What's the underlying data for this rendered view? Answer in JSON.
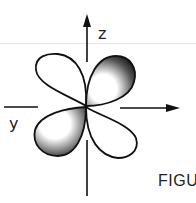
{
  "diagram": {
    "type": "d-orbital lobes",
    "axes": {
      "vertical_label": "z",
      "horizontal_label": "y"
    },
    "caption_fragment": "FIGU",
    "lobes": 4,
    "shaded_lobes": [
      "upper-right",
      "lower-left"
    ]
  }
}
